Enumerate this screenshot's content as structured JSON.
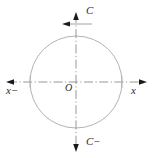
{
  "figure": {
    "type": "coordinate-axes-circle-diagram",
    "origin_label": "O",
    "axes": {
      "vertical_positive_label": "C",
      "vertical_negative_label": "C−",
      "horizontal_positive_label": "x",
      "horizontal_negative_label": "x−"
    },
    "icons": {
      "arrow_up": "arrow-up-icon",
      "arrow_down": "arrow-down-icon",
      "arrow_left": "arrow-left-icon",
      "arrow_right": "arrow-right-icon",
      "arrow_left_small": "arrow-left-small-icon"
    },
    "colors": {
      "circle_stroke": "#b3b3b3",
      "axis_stroke": "#8c8c8c",
      "arrow_fill": "#1a1a1a",
      "text": "#2b2b2b",
      "background": "#ffffff"
    },
    "geometry": {
      "center_x": 76,
      "center_y": 82,
      "radius": 46,
      "axis_line_style": "dash-dot",
      "width": 153,
      "height": 158
    }
  }
}
